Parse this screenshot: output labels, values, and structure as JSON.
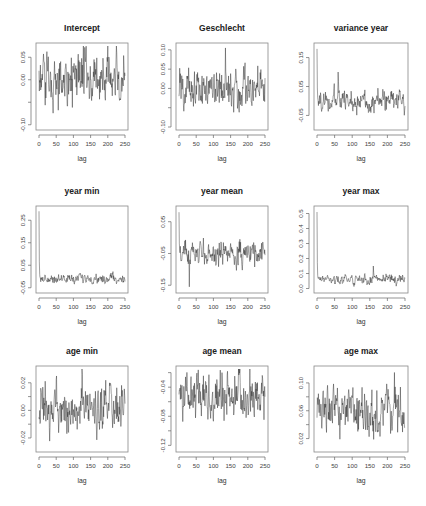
{
  "chart_data": [
    {
      "type": "line",
      "title": "Intercept",
      "xlabel": "lag",
      "ylabel": "",
      "xlim": [
        0,
        250
      ],
      "ylim": [
        -0.105,
        0.075
      ],
      "xticks": [
        0,
        50,
        100,
        150,
        200,
        250
      ],
      "yticks": [
        -0.1,
        -0.05,
        0.0,
        0.05
      ],
      "ytick_labels": [
        "-0.10",
        "",
        "0.00",
        "0.05"
      ],
      "grid": false,
      "series": [
        {
          "name": "Intercept",
          "x_range": [
            0,
            250
          ],
          "initial": 0.02,
          "mean": 0.0,
          "spread": 0.04,
          "spike": null
        }
      ],
      "box": [
        36,
        43,
        128,
        130
      ]
    },
    {
      "type": "line",
      "title": "Geschlecht",
      "xlabel": "lag",
      "ylabel": "",
      "xlim": [
        0,
        250
      ],
      "ylim": [
        -0.1,
        0.11
      ],
      "xticks": [
        0,
        50,
        100,
        150,
        200,
        250
      ],
      "yticks": [
        -0.1,
        -0.05,
        0.0,
        0.05,
        0.1
      ],
      "ytick_labels": [
        "-0.10",
        "",
        "0.00",
        "0.05",
        "0.10"
      ],
      "grid": false,
      "series": [
        {
          "name": "Geschlecht",
          "x_range": [
            0,
            250
          ],
          "initial": -0.02,
          "mean": 0.0,
          "spread": 0.035,
          "spike": [
            135,
            0.105
          ]
        }
      ],
      "box": [
        176,
        43,
        268,
        130
      ]
    },
    {
      "type": "line",
      "title": "variance year",
      "xlabel": "lag",
      "ylabel": "",
      "xlim": [
        0,
        250
      ],
      "ylim": [
        -0.09,
        0.19
      ],
      "xticks": [
        0,
        50,
        100,
        150,
        200,
        250
      ],
      "yticks": [
        -0.05,
        0.05,
        0.15
      ],
      "ytick_labels": [
        "-0.05",
        "0.05",
        "0.15"
      ],
      "grid": false,
      "series": [
        {
          "name": "variance year",
          "x_range": [
            0,
            250
          ],
          "initial": 0.18,
          "mean": 0.0,
          "spread": 0.025,
          "spike": [
            60,
            0.1
          ]
        }
      ],
      "box": [
        314,
        43,
        408,
        130
      ]
    },
    {
      "type": "line",
      "title": "year min",
      "xlabel": "lag",
      "ylabel": "",
      "xlim": [
        0,
        250
      ],
      "ylim": [
        -0.06,
        0.3
      ],
      "xticks": [
        0,
        50,
        100,
        150,
        200,
        250
      ],
      "yticks": [
        -0.05,
        0.05,
        0.15,
        0.25
      ],
      "ytick_labels": [
        "-0.05",
        "0.05",
        "0.15",
        "0.25"
      ],
      "grid": false,
      "series": [
        {
          "name": "year min",
          "x_range": [
            0,
            250
          ],
          "initial": 0.29,
          "mean": -0.01,
          "spread": 0.013,
          "spike": null
        }
      ],
      "box": [
        36,
        206,
        128,
        293
      ]
    },
    {
      "type": "line",
      "title": "year mean",
      "xlabel": "lag",
      "ylabel": "",
      "xlim": [
        0,
        250
      ],
      "ylim": [
        -0.165,
        0.09
      ],
      "xticks": [
        0,
        50,
        100,
        150,
        200,
        250
      ],
      "yticks": [
        -0.15,
        -0.05,
        0.05
      ],
      "ytick_labels": [
        "-0.15",
        "-0.05",
        "0.05"
      ],
      "grid": false,
      "series": [
        {
          "name": "year mean",
          "x_range": [
            0,
            250
          ],
          "initial": 0.08,
          "mean": -0.05,
          "spread": 0.025,
          "spike": [
            30,
            -0.155
          ]
        }
      ],
      "box": [
        176,
        206,
        268,
        293
      ]
    },
    {
      "type": "line",
      "title": "year max",
      "xlabel": "lag",
      "ylabel": "",
      "xlim": [
        0,
        250
      ],
      "ylim": [
        -0.01,
        0.53
      ],
      "xticks": [
        0,
        50,
        100,
        150,
        200,
        250
      ],
      "yticks": [
        0.0,
        0.1,
        0.2,
        0.3,
        0.4,
        0.5
      ],
      "ytick_labels": [
        "0.0",
        "0.1",
        "0.2",
        "0.3",
        "0.4",
        "0.5"
      ],
      "grid": false,
      "series": [
        {
          "name": "year max",
          "x_range": [
            0,
            250
          ],
          "initial": 0.51,
          "mean": 0.06,
          "spread": 0.02,
          "spike": [
            160,
            0.15
          ]
        }
      ],
      "box": [
        314,
        206,
        408,
        293
      ]
    },
    {
      "type": "line",
      "title": "age min",
      "xlabel": "lag",
      "ylabel": "",
      "xlim": [
        0,
        250
      ],
      "ylim": [
        -0.028,
        0.03
      ],
      "xticks": [
        0,
        50,
        100,
        150,
        200,
        250
      ],
      "yticks": [
        -0.02,
        -0.01,
        0.0,
        0.01,
        0.02
      ],
      "ytick_labels": [
        "-0.02",
        "",
        "0.00",
        "",
        "0.02"
      ],
      "grid": false,
      "series": [
        {
          "name": "age min",
          "x_range": [
            0,
            250
          ],
          "initial": -0.005,
          "mean": 0.0,
          "spread": 0.011,
          "spike": [
            125,
            0.03
          ]
        }
      ],
      "box": [
        36,
        366,
        128,
        452
      ]
    },
    {
      "type": "line",
      "title": "age mean",
      "xlabel": "lag",
      "ylabel": "",
      "xlim": [
        0,
        250
      ],
      "ylim": [
        -0.125,
        -0.015
      ],
      "xticks": [
        0,
        50,
        100,
        150,
        200,
        250
      ],
      "yticks": [
        -0.12,
        -0.1,
        -0.08,
        -0.06,
        -0.04,
        -0.02
      ],
      "ytick_labels": [
        "-0.12",
        "",
        "-0.08",
        "",
        "-0.04",
        ""
      ],
      "grid": false,
      "series": [
        {
          "name": "age mean",
          "x_range": [
            0,
            250
          ],
          "initial": -0.05,
          "mean": -0.055,
          "spread": 0.022,
          "spike": [
            125,
            -0.02
          ]
        }
      ],
      "box": [
        176,
        366,
        268,
        452
      ]
    },
    {
      "type": "line",
      "title": "age max",
      "xlabel": "lag",
      "ylabel": "",
      "xlim": [
        0,
        250
      ],
      "ylim": [
        0.005,
        0.12
      ],
      "xticks": [
        0,
        50,
        100,
        150,
        200,
        250
      ],
      "yticks": [
        0.02,
        0.04,
        0.06,
        0.08,
        0.1
      ],
      "ytick_labels": [
        "0.02",
        "",
        "0.06",
        "",
        "0.10"
      ],
      "grid": false,
      "series": [
        {
          "name": "age max",
          "x_range": [
            0,
            250
          ],
          "initial": 0.05,
          "mean": 0.055,
          "spread": 0.022,
          "spike": [
            220,
            0.115
          ]
        }
      ],
      "box": [
        314,
        366,
        408,
        452
      ]
    }
  ]
}
